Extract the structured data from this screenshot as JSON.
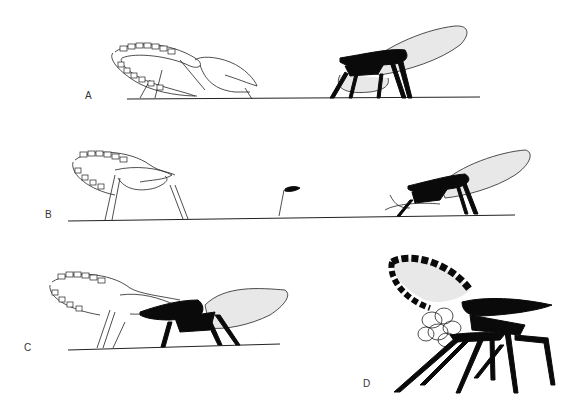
{
  "figure": {
    "panels": [
      {
        "label": "A",
        "content": "White outline insect (left) and black-bodied insect with stippled antennae loop (right) on ground line"
      },
      {
        "label": "B",
        "content": "White outline insect (left), small stalked object (center), black-bodied insect (right) on ground line"
      },
      {
        "label": "C",
        "content": "White outline insect overlapping black-bodied insect with stippled antennae loop on ground line"
      },
      {
        "label": "D",
        "content": "Black insect with black-and-white banded looped antenna and clustered eggs"
      }
    ]
  },
  "labels": {
    "a": "A",
    "b": "B",
    "c": "C",
    "d": "D"
  },
  "colors": {
    "ink": "#0a0a0a",
    "stipple": "#e8e8e8",
    "background": "#ffffff"
  }
}
